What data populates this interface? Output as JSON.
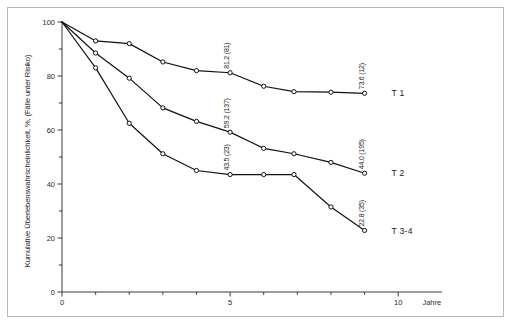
{
  "chart_data": {
    "type": "line",
    "title": "",
    "xlabel": "Jahre",
    "ylabel": "Kumulative Überlebenswahrscheinlichkeit, %, (Fälle unter Risiko)",
    "xlim": [
      0,
      11.6
    ],
    "ylim": [
      0,
      100
    ],
    "xticks": [
      0,
      1,
      2,
      3,
      4,
      5,
      6,
      7,
      8,
      9,
      10
    ],
    "xticklabels": [
      "0",
      "",
      "",
      "",
      "",
      "5",
      "",
      "",
      "",
      "",
      "10"
    ],
    "yticks": [
      0,
      10,
      20,
      30,
      40,
      50,
      60,
      70,
      80,
      90,
      100
    ],
    "yticklabels": [
      "0",
      "",
      "20",
      "",
      "40",
      "",
      "60",
      "",
      "80",
      "",
      "100"
    ],
    "grid": false,
    "legend_position": "right-inline",
    "marker": "open-circle",
    "series": [
      {
        "name": "T 1",
        "label": "T 1",
        "x": [
          0,
          1,
          2,
          3,
          4,
          5,
          6,
          6.9,
          8,
          9
        ],
        "values": [
          100,
          93,
          92,
          85.2,
          82,
          81.2,
          76.2,
          74.2,
          74.0,
          73.6
        ],
        "annotations": [
          {
            "x": 5,
            "y": 81.2,
            "text": "81.2 (81)"
          },
          {
            "x": 9,
            "y": 73.6,
            "text": "73.6 (12)"
          }
        ]
      },
      {
        "name": "T 2",
        "label": "T 2",
        "x": [
          0,
          1,
          2,
          3,
          4,
          5,
          6,
          6.9,
          8,
          9
        ],
        "values": [
          100,
          88.5,
          79.2,
          68.2,
          63.2,
          59.2,
          53.2,
          51.2,
          48.0,
          44.0
        ],
        "annotations": [
          {
            "x": 5,
            "y": 59.2,
            "text": "59.2 (137)"
          },
          {
            "x": 9,
            "y": 44.0,
            "text": "44.0 (195)"
          }
        ]
      },
      {
        "name": "T 3-4",
        "label": "T 3-4",
        "x": [
          0,
          1,
          2,
          3,
          4,
          5,
          6,
          6.9,
          8,
          9
        ],
        "values": [
          100,
          83.0,
          62.5,
          51.2,
          45.0,
          43.5,
          43.5,
          43.5,
          31.5,
          22.8
        ],
        "annotations": [
          {
            "x": 5,
            "y": 43.5,
            "text": "43.5 (23)"
          },
          {
            "x": 9,
            "y": 22.8,
            "text": "22.8 (35)"
          }
        ]
      }
    ]
  },
  "axes": {
    "x_title": "Jahre",
    "y_title": "Kumulative Überlebenswahrscheinlichkeit, %, (Fälle unter Risiko)"
  },
  "colors": {
    "line": "#111111",
    "axis": "#3a3a3a",
    "frame": "#b9b9b9",
    "background": "#ffffff"
  }
}
